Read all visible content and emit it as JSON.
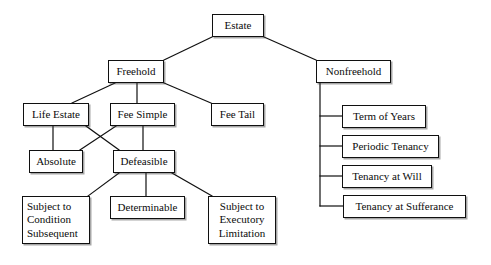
{
  "diagram": {
    "title": "Estate",
    "kind": "hierarchy-tree",
    "canvas": {
      "width": 491,
      "height": 265,
      "background": "#ffffff"
    },
    "style": {
      "box_border": "#101010",
      "box_fill": "#ffffff",
      "text_color": "#0b0b0b",
      "edge_color": "#101010"
    },
    "nodes": [
      {
        "id": "estate",
        "label": "Estate",
        "x": 212,
        "y": 14,
        "w": 52,
        "h": 23,
        "align": "center"
      },
      {
        "id": "freehold",
        "label": "Freehold",
        "x": 108,
        "y": 60,
        "w": 56,
        "h": 23,
        "align": "center"
      },
      {
        "id": "nonfreehold",
        "label": "Nonfreehold",
        "x": 316,
        "y": 60,
        "w": 75,
        "h": 23,
        "align": "center"
      },
      {
        "id": "life-estate",
        "label": "Life Estate",
        "x": 23,
        "y": 103,
        "w": 66,
        "h": 23,
        "align": "center"
      },
      {
        "id": "fee-simple",
        "label": "Fee Simple",
        "x": 110,
        "y": 103,
        "w": 65,
        "h": 23,
        "align": "center"
      },
      {
        "id": "fee-tail",
        "label": "Fee Tail",
        "x": 211,
        "y": 103,
        "w": 53,
        "h": 23,
        "align": "center"
      },
      {
        "id": "absolute",
        "label": "Absolute",
        "x": 29,
        "y": 150,
        "w": 54,
        "h": 23,
        "align": "center"
      },
      {
        "id": "defeasible",
        "label": "Defeasible",
        "x": 113,
        "y": 150,
        "w": 62,
        "h": 23,
        "align": "center"
      },
      {
        "id": "scs",
        "label": "Subject to\nCondition\nSubsequent",
        "x": 22,
        "y": 196,
        "w": 68,
        "h": 48,
        "align": "left"
      },
      {
        "id": "determinable",
        "label": "Determinable",
        "x": 110,
        "y": 196,
        "w": 75,
        "h": 23,
        "align": "center"
      },
      {
        "id": "sel",
        "label": "Subject to\nExecutory\nLimitation",
        "x": 208,
        "y": 196,
        "w": 68,
        "h": 48,
        "align": "center"
      },
      {
        "id": "term-of-years",
        "label": "Term of Years",
        "x": 342,
        "y": 105,
        "w": 84,
        "h": 23,
        "align": "center"
      },
      {
        "id": "periodic",
        "label": "Periodic Tenancy",
        "x": 342,
        "y": 135,
        "w": 97,
        "h": 23,
        "align": "center"
      },
      {
        "id": "at-will",
        "label": "Tenancy at Will",
        "x": 342,
        "y": 165,
        "w": 90,
        "h": 23,
        "align": "center"
      },
      {
        "id": "sufferance",
        "label": "Tenancy at Sufferance",
        "x": 343,
        "y": 195,
        "w": 123,
        "h": 23,
        "align": "center"
      }
    ],
    "edges": [
      {
        "from": "estate",
        "to": "freehold",
        "type": "diagonal",
        "points": "212,37 164,60"
      },
      {
        "from": "estate",
        "to": "nonfreehold",
        "type": "diagonal",
        "points": "264,37 316,60"
      },
      {
        "from": "freehold",
        "to": "life-estate",
        "type": "diagonal",
        "points": "115,83 72,103"
      },
      {
        "from": "freehold",
        "to": "fee-simple",
        "type": "vertical",
        "points": "137,83 137,103"
      },
      {
        "from": "freehold",
        "to": "fee-tail",
        "type": "diagonal",
        "points": "164,83 211,103"
      },
      {
        "from": "life-estate",
        "to": "absolute",
        "type": "vertical",
        "points": "53,126 53,150"
      },
      {
        "from": "life-estate",
        "to": "defeasible",
        "type": "diagonal",
        "points": "86,126 119,150"
      },
      {
        "from": "fee-simple",
        "to": "absolute",
        "type": "diagonal",
        "points": "116,126 80,150"
      },
      {
        "from": "fee-simple",
        "to": "defeasible",
        "type": "vertical",
        "points": "143,126 143,150"
      },
      {
        "from": "defeasible",
        "to": "scs",
        "type": "diagonal",
        "points": "119,173 88,196"
      },
      {
        "from": "defeasible",
        "to": "determinable",
        "type": "vertical",
        "points": "146,173 146,196"
      },
      {
        "from": "defeasible",
        "to": "sel",
        "type": "diagonal",
        "points": "172,173 212,196"
      },
      {
        "from": "nonfreehold",
        "to": "spine",
        "type": "vertical",
        "points": "320,83 320,206"
      },
      {
        "from": "spine",
        "to": "term-of-years",
        "type": "horizontal",
        "points": "320,116 342,116"
      },
      {
        "from": "spine",
        "to": "periodic",
        "type": "horizontal",
        "points": "320,146 342,146"
      },
      {
        "from": "spine",
        "to": "at-will",
        "type": "horizontal",
        "points": "320,176 342,176"
      },
      {
        "from": "spine",
        "to": "sufferance",
        "type": "horizontal",
        "points": "320,206 343,206"
      }
    ]
  }
}
